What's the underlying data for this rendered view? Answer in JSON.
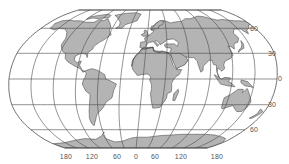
{
  "map": {
    "projection": "world-graticule-robinson-like",
    "colors": {
      "land": "#b4b4b4",
      "land_stroke": "#3a3a3a",
      "graticule": "#4a4a4a",
      "ocean": "#ffffff",
      "label": "#555555"
    },
    "latitude_labels": [
      {
        "text": "60",
        "lat": 60,
        "x": 250,
        "y": 25
      },
      {
        "text": "30",
        "lat": 30,
        "x": 268,
        "y": 50
      },
      {
        "text": "0",
        "lat": 0,
        "x": 278,
        "y": 75
      },
      {
        "text": "30",
        "lat": -30,
        "x": 268,
        "y": 101
      },
      {
        "text": "60",
        "lat": -60,
        "x": 250,
        "y": 126
      }
    ],
    "longitude_labels": [
      {
        "text": "180",
        "lon": -180,
        "x": 66
      },
      {
        "text": "120",
        "lon": -120,
        "x": 92
      },
      {
        "text": "60",
        "lon": -60,
        "x": 117
      },
      {
        "text": "0",
        "lon": 0,
        "x": 136
      },
      {
        "text": "60",
        "lon": 60,
        "x": 155
      },
      {
        "text": "120",
        "lon": 120,
        "x": 181
      },
      {
        "text": "180",
        "lon": 180,
        "x": 217
      }
    ],
    "longitude_label_y": 153
  }
}
